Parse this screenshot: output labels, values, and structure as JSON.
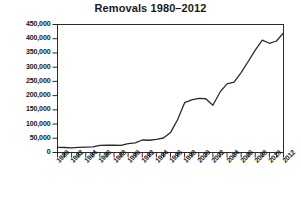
{
  "chart_data": {
    "type": "line",
    "title": "Removals 1980–2012",
    "xlabel": "",
    "ylabel": "",
    "grid": false,
    "legend": false,
    "xlim": [
      1980,
      2012
    ],
    "ylim": [
      0,
      450000
    ],
    "ytick_labels": [
      "450,000",
      "400,000",
      "350,000",
      "300,000",
      "250,000",
      "200,000",
      "150,000",
      "100,000",
      "50,000",
      "0"
    ],
    "ytick_values": [
      450000,
      400000,
      350000,
      300000,
      250000,
      200000,
      150000,
      100000,
      50000,
      0
    ],
    "xtick_labels": [
      "1980",
      "1982",
      "1984",
      "1986",
      "1988",
      "1990",
      "1992",
      "1994",
      "1996",
      "1998",
      "2000",
      "2002",
      "2004",
      "2006",
      "2008",
      "2010",
      "2012"
    ],
    "xtick_values": [
      1980,
      1982,
      1984,
      1986,
      1988,
      1990,
      1992,
      1994,
      1996,
      1998,
      2000,
      2002,
      2004,
      2006,
      2008,
      2010,
      2012
    ],
    "x": [
      1980,
      1981,
      1982,
      1983,
      1984,
      1985,
      1986,
      1987,
      1988,
      1989,
      1990,
      1991,
      1992,
      1993,
      1994,
      1995,
      1996,
      1997,
      1998,
      1999,
      2000,
      2001,
      2002,
      2003,
      2004,
      2005,
      2006,
      2007,
      2008,
      2009,
      2010,
      2011,
      2012
    ],
    "values": [
      18000,
      17500,
      16500,
      18000,
      19000,
      20000,
      25000,
      25500,
      26000,
      25000,
      31000,
      34000,
      44000,
      43000,
      46000,
      51000,
      70000,
      115000,
      175000,
      185000,
      190000,
      189000,
      166000,
      212000,
      241000,
      247000,
      281000,
      320000,
      360000,
      395000,
      384000,
      392000,
      420000
    ]
  }
}
